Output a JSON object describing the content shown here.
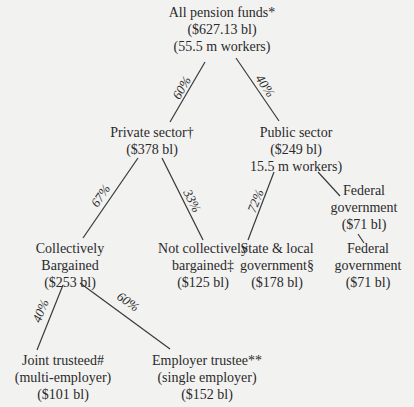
{
  "diagram": {
    "colors": {
      "background": "#f2f2f1",
      "text": "#2a2a2a",
      "lines": "#3a3a3a"
    },
    "nodes": {
      "all": {
        "label": "All pension funds*",
        "value": "($627.13 bl)",
        "workers": "(55.5 m workers)"
      },
      "private": {
        "label": "Private sector†",
        "value": "($378 bl)"
      },
      "public": {
        "label": "Public sector",
        "value": "($249 bl)",
        "workers": "15.5 m workers)"
      },
      "federal_upper": {
        "label_1": "Federal",
        "label_2": "government",
        "value": "($71 bl)"
      },
      "collectively": {
        "label_1": "Collectively",
        "label_2": "Bargained",
        "value": "($253 bl)"
      },
      "not_collectively": {
        "label_1": "Not collectively",
        "label_2": "bargained‡",
        "value": "($125 bl)"
      },
      "state_local": {
        "label_1": "State & local",
        "label_2": "government§",
        "value": "($178 bl)"
      },
      "federal_lower": {
        "label_1": "Federal",
        "label_2": "government",
        "value": "($71 bl)"
      },
      "joint": {
        "label_1": "Joint trusteed#",
        "label_2": "(multi-employer)",
        "value": "($101 bl)"
      },
      "employer": {
        "label_1": "Employer trustee**",
        "label_2": "(single employer)",
        "value": "($152 bl)"
      }
    },
    "edges": {
      "all_to_private": "60%",
      "all_to_public": "40%",
      "private_to_collectively": "67%",
      "private_to_not": "33%",
      "public_to_state": "72%",
      "collectively_to_joint": "40%",
      "collectively_to_employer": "60%"
    }
  }
}
